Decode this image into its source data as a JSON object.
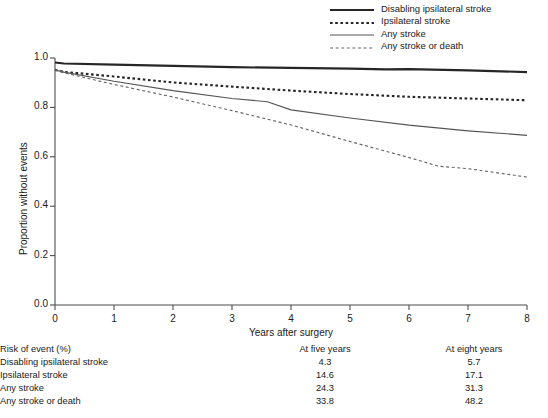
{
  "legend": {
    "items": [
      {
        "label": "Disabling ipsilateral stroke",
        "style": "solid-thick",
        "color": "#262626"
      },
      {
        "label": "Ipsilateral stroke",
        "style": "dotted-thick",
        "color": "#262626"
      },
      {
        "label": "Any stroke",
        "style": "solid-thin",
        "color": "#555555"
      },
      {
        "label": "Any stroke or death",
        "style": "dashed-thin",
        "color": "#666666"
      }
    ]
  },
  "table": {
    "header": {
      "label": "Risk of event (%)",
      "five": "At five years",
      "eight": "At eight years"
    },
    "rows": [
      {
        "label": "Disabling ipsilateral stroke",
        "five": "4.3",
        "eight": "5.7"
      },
      {
        "label": "Ipsilateral stroke",
        "five": "14.6",
        "eight": "17.1"
      },
      {
        "label": "Any stroke",
        "five": "24.3",
        "eight": "31.3"
      },
      {
        "label": "Any stroke or death",
        "five": "33.8",
        "eight": "48.2"
      }
    ]
  },
  "chart_data": {
    "type": "line",
    "title": "",
    "xlabel": "Years after surgery",
    "ylabel": "Proportion without events",
    "xlim": [
      0,
      8
    ],
    "ylim": [
      0,
      1
    ],
    "xticks": [
      "0",
      "1",
      "2",
      "3",
      "4",
      "5",
      "6",
      "7",
      "8"
    ],
    "yticks": [
      "0.0",
      "0.2",
      "0.4",
      "0.6",
      "0.8",
      "1.0"
    ],
    "grid": false,
    "legend_position": "top-right",
    "series": [
      {
        "name": "Disabling ipsilateral stroke",
        "style": "solid-thick",
        "color": "#262626",
        "x": [
          0,
          0.15,
          1,
          2,
          3,
          4,
          5,
          5.6,
          6,
          7,
          8
        ],
        "y": [
          0.982,
          0.978,
          0.973,
          0.968,
          0.963,
          0.96,
          0.957,
          0.954,
          0.955,
          0.95,
          0.943
        ]
      },
      {
        "name": "Ipsilateral stroke",
        "style": "dotted-thick",
        "color": "#262626",
        "x": [
          0,
          0.15,
          1,
          2,
          3,
          4,
          5,
          6,
          7,
          8
        ],
        "y": [
          0.952,
          0.944,
          0.925,
          0.901,
          0.884,
          0.868,
          0.854,
          0.843,
          0.836,
          0.829
        ]
      },
      {
        "name": "Any stroke",
        "style": "solid-thin",
        "color": "#555555",
        "x": [
          0,
          0.15,
          1,
          2,
          3,
          3.6,
          4,
          5,
          6,
          7,
          8
        ],
        "y": [
          0.952,
          0.943,
          0.906,
          0.868,
          0.836,
          0.823,
          0.79,
          0.757,
          0.728,
          0.705,
          0.687
        ]
      },
      {
        "name": "Any stroke or death",
        "style": "dashed-thin",
        "color": "#666666",
        "x": [
          0,
          0.15,
          1,
          2,
          3,
          4,
          5,
          6,
          6.5,
          7,
          8
        ],
        "y": [
          0.952,
          0.94,
          0.893,
          0.842,
          0.787,
          0.729,
          0.662,
          0.597,
          0.562,
          0.552,
          0.518
        ]
      }
    ]
  }
}
